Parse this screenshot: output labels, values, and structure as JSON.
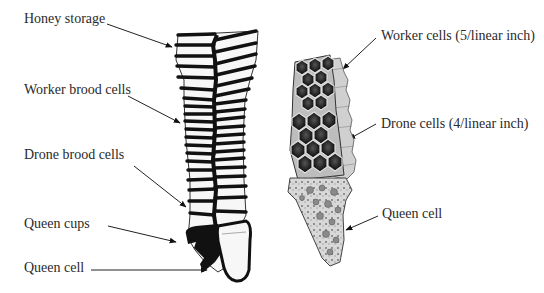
{
  "diagram": {
    "left_labels": [
      {
        "id": "honey-storage",
        "text": "Honey storage",
        "x": 24,
        "y": 11
      },
      {
        "id": "worker-brood-cells",
        "text": "Worker brood cells",
        "x": 24,
        "y": 82
      },
      {
        "id": "drone-brood-cells",
        "text": "Drone brood cells",
        "x": 24,
        "y": 147
      },
      {
        "id": "queen-cups",
        "text": "Queen cups",
        "x": 24,
        "y": 216
      },
      {
        "id": "queen-cell-left",
        "text": "Queen cell",
        "x": 24,
        "y": 260
      }
    ],
    "right_labels": [
      {
        "id": "worker-cells",
        "text": "Worker cells (5/linear inch)",
        "x": 381,
        "y": 28
      },
      {
        "id": "drone-cells",
        "text": "Drone cells (4/linear inch)",
        "x": 381,
        "y": 116
      },
      {
        "id": "queen-cell-right",
        "text": "Queen cell",
        "x": 382,
        "y": 206
      }
    ],
    "colors": {
      "ink": "#111111",
      "text": "#2a2a2a",
      "cell_fill": "#f7f7f7",
      "hex_dark": "#1e1e1e",
      "hex_mid": "#8a8a8a",
      "background": "#ffffff"
    }
  }
}
